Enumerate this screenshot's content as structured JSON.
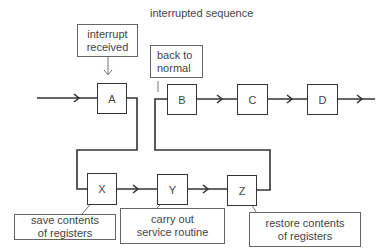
{
  "title": "interrupted sequence",
  "main_sequence": [
    {
      "id": "A",
      "label": "A"
    },
    {
      "id": "B",
      "label": "B"
    },
    {
      "id": "C",
      "label": "C"
    },
    {
      "id": "D",
      "label": "D"
    }
  ],
  "interrupt_routine": [
    {
      "id": "X",
      "label": "X"
    },
    {
      "id": "Y",
      "label": "Y"
    },
    {
      "id": "Z",
      "label": "Z"
    }
  ],
  "annotations": {
    "interrupt_received": [
      "interrupt",
      "received"
    ],
    "back_to_normal": [
      "back to",
      "normal"
    ],
    "save_contents": [
      "save contents",
      "of registers"
    ],
    "carry_out": [
      "carry out",
      "service routine"
    ],
    "restore_contents": [
      "restore contents",
      "of registers"
    ]
  },
  "colors": {
    "line": "#333333",
    "note_border": "#666666",
    "text": "#444444"
  }
}
